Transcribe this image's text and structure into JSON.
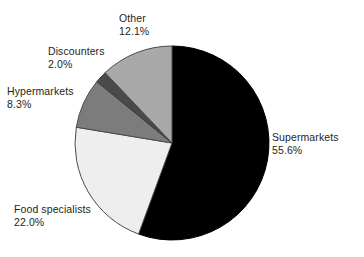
{
  "chart_data": {
    "type": "pie",
    "title": "",
    "subtitle": "",
    "xlabel": "",
    "ylabel": "",
    "unit": "%",
    "legend_position": "none",
    "labels_position": "outside",
    "grid": false,
    "start_angle_deg": 0,
    "direction": "clockwise",
    "categories": [
      "Supermarkets",
      "Food specialists",
      "Hypermarkets",
      "Discounters",
      "Other"
    ],
    "values": [
      55.6,
      22.0,
      8.3,
      2.0,
      12.1
    ],
    "colors": [
      "#000000",
      "#eeeeee",
      "#7c7c7c",
      "#4a4a4a",
      "#a9a9a9"
    ],
    "slices": [
      {
        "name": "Supermarkets",
        "value": 55.6,
        "value_text": "55.6%",
        "color": "#000000",
        "stroke": "#000000"
      },
      {
        "name": "Food specialists",
        "value": 22.0,
        "value_text": "22.0%",
        "color": "#eeeeee",
        "stroke": "#4a4a4a"
      },
      {
        "name": "Hypermarkets",
        "value": 8.3,
        "value_text": "8.3%",
        "color": "#7c7c7c",
        "stroke": "#4a4a4a"
      },
      {
        "name": "Discounters",
        "value": 2.0,
        "value_text": "2.0%",
        "color": "#4a4a4a",
        "stroke": "#3a3a3a"
      },
      {
        "name": "Other",
        "value": 12.1,
        "value_text": "12.1%",
        "color": "#a9a9a9",
        "stroke": "#4a4a4a"
      }
    ]
  },
  "labels": {
    "other": {
      "name": "Other",
      "value": "12.1%"
    },
    "discounters": {
      "name": "Discounters",
      "value": "2.0%"
    },
    "hypermarkets": {
      "name": "Hypermarkets",
      "value": "8.3%"
    },
    "supermarkets": {
      "name": "Supermarkets",
      "value": "55.6%"
    },
    "foodspec": {
      "name": "Food specialists",
      "value": "22.0%"
    }
  }
}
